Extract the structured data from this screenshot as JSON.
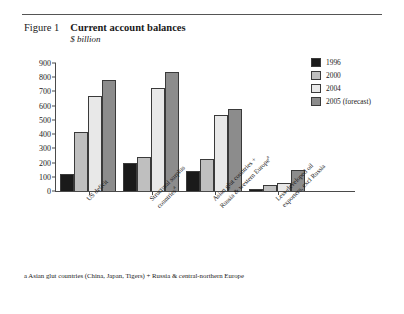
{
  "figure": {
    "label": "Figure 1",
    "title": "Current account balances",
    "subtitle": "$ billion"
  },
  "footnote": "a Asian glut countries (China, Japan, Tigers) + Russia & central-northern Europe",
  "colors": {
    "series_1996": "#1a1a1a",
    "series_2000": "#bfbfbf",
    "series_2004": "#e8e8e8",
    "series_2005": "#8c8c8c",
    "axis": "#4a4a4a",
    "text": "#1a1a1a",
    "background": "#ffffff"
  },
  "chart_data": {
    "type": "bar",
    "title": "Current account balances",
    "subtitle": "$ billion",
    "xlabel": "",
    "ylabel": "$ billion",
    "ylim": [
      0,
      900
    ],
    "yticks": [
      0,
      100,
      200,
      300,
      400,
      500,
      600,
      700,
      800,
      900
    ],
    "grid": false,
    "legend_position": "top-right",
    "categories": [
      "US deficit",
      "Structural surplus countries",
      "Asian glut countries + Russia & western Europe",
      "Less-developed oil exporters, excl Russia"
    ],
    "category_labels": [
      {
        "line1": "US deficit",
        "line2": "",
        "superscript": ""
      },
      {
        "line1": "Structural surplus",
        "line2": "countries",
        "superscript": "a"
      },
      {
        "line1": "Asian glut countries +",
        "line2": "Russia & western Europe",
        "superscript": "a"
      },
      {
        "line1": "Less-developed oil",
        "line2": "exporters, excl Russia",
        "superscript": ""
      }
    ],
    "series": [
      {
        "name": "1996",
        "color": "#1a1a1a",
        "values": [
          120,
          195,
          140,
          15
        ]
      },
      {
        "name": "2000",
        "color": "#bfbfbf",
        "values": [
          415,
          240,
          225,
          45
        ]
      },
      {
        "name": "2004",
        "color": "#e8e8e8",
        "values": [
          670,
          725,
          535,
          58
        ]
      },
      {
        "name": "2005 (forecast)",
        "color": "#8c8c8c",
        "values": [
          780,
          835,
          575,
          150
        ]
      }
    ]
  }
}
